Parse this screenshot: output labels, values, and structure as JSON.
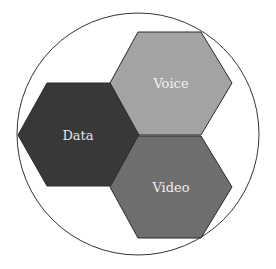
{
  "diagram": {
    "type": "hexagon-cluster-in-circle",
    "circle": {
      "cx": 138,
      "cy": 134,
      "r": 121,
      "stroke": "#333333",
      "fill": "#ffffff"
    },
    "hexagons": [
      {
        "id": "voice",
        "label": "Voice",
        "fill": "#a3a3a3",
        "text_color": "#f2f2f2",
        "points": "138,32 201,32 232,83 201,135 138,135 110,83",
        "label_x": 171,
        "label_y": 88
      },
      {
        "id": "data",
        "label": "Data",
        "fill": "#383838",
        "text_color": "#e6e6e6",
        "points": "47,83 110,83 139,135 110,186 47,186 18,135",
        "label_x": 78,
        "label_y": 140
      },
      {
        "id": "video",
        "label": "Video",
        "fill": "#6e6e6e",
        "text_color": "#eeeeee",
        "points": "138,136 201,136 232,187 201,238 138,238 110,187",
        "label_x": 171,
        "label_y": 192
      }
    ],
    "stroke": "#2a2a2a"
  }
}
